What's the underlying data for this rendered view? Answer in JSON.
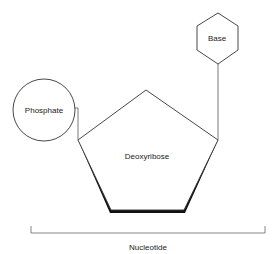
{
  "diagram": {
    "type": "nucleotide-structure",
    "nodes": {
      "base": {
        "label": "Base",
        "shape": "hexagon"
      },
      "phosphate": {
        "label": "Phosphate",
        "shape": "circle"
      },
      "sugar": {
        "label": "Deoxyribose",
        "shape": "pentagon"
      }
    },
    "bracket": {
      "label": "Nucleotide"
    },
    "colors": {
      "stroke": "#333333",
      "fill": "#ffffff",
      "shadow": "#111111",
      "text": "#222222"
    }
  }
}
